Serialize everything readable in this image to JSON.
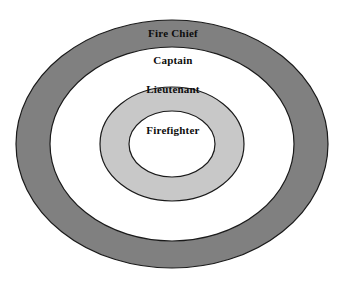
{
  "diagram": {
    "type": "concentric-ellipses",
    "canvas": {
      "width": 346,
      "height": 281,
      "background": "#ffffff"
    },
    "center": {
      "x": 172,
      "y": 144
    },
    "rings": [
      {
        "id": "fire-chief",
        "label": "Fire Chief",
        "level": 1,
        "fill": "#808080",
        "stroke": "#1a1a1a",
        "rx": 156,
        "ry": 124,
        "label_y": 33
      },
      {
        "id": "captain",
        "label": "Captain",
        "level": 2,
        "fill": "#ffffff",
        "stroke": "#1a1a1a",
        "rx": 122,
        "ry": 97,
        "label_y": 60
      },
      {
        "id": "lieutenant",
        "label": "Lieutenant",
        "level": 3,
        "fill": "#c8c8c8",
        "stroke": "#1a1a1a",
        "rx": 72,
        "ry": 57,
        "label_y": 89
      },
      {
        "id": "firefighter",
        "label": "Firefighter",
        "level": 4,
        "fill": "#ffffff",
        "stroke": "#1a1a1a",
        "rx": 43,
        "ry": 33,
        "label_y": 130
      }
    ],
    "colors": {
      "outer_ring_gray": "#808080",
      "inner_ring_gray": "#c8c8c8",
      "white": "#ffffff",
      "outline": "#1a1a1a",
      "text": "#0d0d0d"
    }
  }
}
